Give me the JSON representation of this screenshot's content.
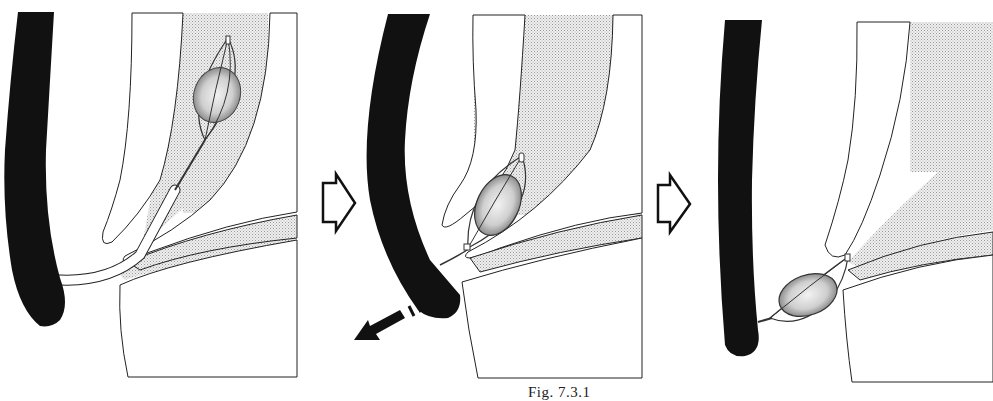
{
  "figure": {
    "caption": "Fig. 7.3.1",
    "panels": [
      {
        "id": 1,
        "label": "Stone captured in basket inside duct"
      },
      {
        "id": 2,
        "label": "Basket with stone pulled down to papilla; endoscope withdrawn"
      },
      {
        "id": 3,
        "label": "Stone in basket extracted through papilla"
      }
    ],
    "arrows": [
      {
        "type": "step-arrow",
        "from_panel": 1,
        "to_panel": 2
      },
      {
        "type": "step-arrow",
        "from_panel": 2,
        "to_panel": 3
      },
      {
        "type": "withdraw-arrow",
        "panel": 2,
        "direction": "down-left"
      }
    ],
    "colors": {
      "scope": "#111111",
      "outline": "#222222",
      "duct_fill": "#d9d9d9",
      "background": "#ffffff"
    }
  }
}
